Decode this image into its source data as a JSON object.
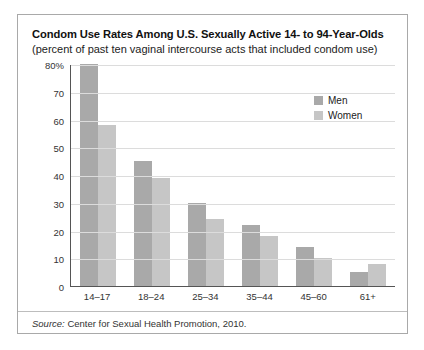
{
  "figure": {
    "title": "Condom Use Rates Among U.S. Sexually Active 14- to 94-Year-Olds",
    "subtitle": "(percent of past ten vaginal intercourse acts that included condom use)",
    "source_prefix": "Source:",
    "source_text": " Center for Sexual Health Promotion, 2010."
  },
  "legend": {
    "position": "top-right",
    "entries": [
      {
        "label": "Men",
        "color": "#a9a9a9"
      },
      {
        "label": "Women",
        "color": "#c6c6c6"
      }
    ]
  },
  "chart_data": {
    "type": "bar",
    "title": "Condom Use Rates Among U.S. Sexually Active 14- to 94-Year-Olds",
    "subtitle": "(percent of past ten vaginal intercourse acts that included condom use)",
    "xlabel": "",
    "ylabel": "",
    "ylim": [
      0,
      80
    ],
    "yticks": [
      0,
      10,
      20,
      30,
      40,
      50,
      60,
      70,
      80
    ],
    "ytick_labels": [
      "0",
      "10",
      "20",
      "30",
      "40",
      "50",
      "60",
      "70",
      "80%"
    ],
    "grid": "horizontal",
    "legend_position": "top-right",
    "categories": [
      "14–17",
      "18–24",
      "25–34",
      "35–44",
      "45–60",
      "61+"
    ],
    "series": [
      {
        "name": "Men",
        "color": "#a9a9a9",
        "values": [
          80,
          45,
          30,
          22,
          14,
          5
        ]
      },
      {
        "name": "Women",
        "color": "#c6c6c6",
        "values": [
          58,
          39,
          24,
          18,
          10,
          8
        ]
      }
    ],
    "source": "Source: Center for Sexual Health Promotion, 2010."
  }
}
